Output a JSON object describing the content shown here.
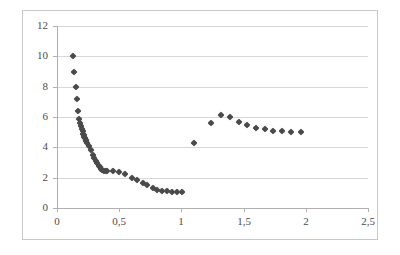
{
  "chart": {
    "title": "",
    "subtitle": "",
    "marker_color": "#4a4a4a",
    "gridline_color": "#d7d7d7",
    "axis_color": "#b0b0b0",
    "frame_color": "#c9c9c9",
    "background_color": "#ffffff"
  },
  "axes": {
    "x": {
      "label": "",
      "min": 0,
      "max": 2.5,
      "tick_step": 0.5,
      "tick_labels": [
        "0",
        "0,5",
        "1",
        "1,5",
        "2",
        "2,5"
      ],
      "tick_values": [
        0,
        0.5,
        1,
        1.5,
        2,
        2.5
      ]
    },
    "y": {
      "label": "",
      "min": 0,
      "max": 12,
      "tick_step": 2,
      "tick_labels": [
        "0",
        "2",
        "4",
        "6",
        "8",
        "10",
        "12"
      ],
      "tick_values": [
        0,
        2,
        4,
        6,
        8,
        10,
        12
      ]
    }
  },
  "chart_data": {
    "type": "scatter",
    "title": "",
    "xlabel": "",
    "ylabel": "",
    "xlim": [
      0,
      2.5
    ],
    "ylim": [
      0,
      12
    ],
    "grid": true,
    "legend": false,
    "xtick_labels": [
      "0",
      "0,5",
      "1",
      "1,5",
      "2",
      "2,5"
    ],
    "ytick_labels": [
      "0",
      "2",
      "4",
      "6",
      "8",
      "10",
      "12"
    ],
    "series": [
      {
        "name": "series-1",
        "marker": "diamond",
        "color": "#4a4a4a",
        "points": [
          [
            0.13,
            10.0
          ],
          [
            0.14,
            9.0
          ],
          [
            0.15,
            8.0
          ],
          [
            0.16,
            7.2
          ],
          [
            0.17,
            6.4
          ],
          [
            0.18,
            5.85
          ],
          [
            0.185,
            5.6
          ],
          [
            0.19,
            5.4
          ],
          [
            0.2,
            5.2
          ],
          [
            0.205,
            5.05
          ],
          [
            0.21,
            4.9
          ],
          [
            0.215,
            4.8
          ],
          [
            0.22,
            4.7
          ],
          [
            0.225,
            4.6
          ],
          [
            0.23,
            4.5
          ],
          [
            0.235,
            4.45
          ],
          [
            0.245,
            4.3
          ],
          [
            0.26,
            4.1
          ],
          [
            0.275,
            3.8
          ],
          [
            0.29,
            3.5
          ],
          [
            0.3,
            3.3
          ],
          [
            0.315,
            3.1
          ],
          [
            0.325,
            2.95
          ],
          [
            0.335,
            2.8
          ],
          [
            0.345,
            2.7
          ],
          [
            0.355,
            2.6
          ],
          [
            0.365,
            2.5
          ],
          [
            0.375,
            2.45
          ],
          [
            0.39,
            2.45
          ],
          [
            0.405,
            2.45
          ],
          [
            0.45,
            2.45
          ],
          [
            0.5,
            2.35
          ],
          [
            0.545,
            2.25
          ],
          [
            0.6,
            2.0
          ],
          [
            0.645,
            1.85
          ],
          [
            0.69,
            1.65
          ],
          [
            0.725,
            1.5
          ],
          [
            0.77,
            1.35
          ],
          [
            0.805,
            1.2
          ],
          [
            0.845,
            1.1
          ],
          [
            0.885,
            1.1
          ],
          [
            0.925,
            1.05
          ],
          [
            0.965,
            1.05
          ],
          [
            1.005,
            1.05
          ]
        ]
      },
      {
        "name": "series-2",
        "marker": "diamond",
        "color": "#4a4a4a",
        "points": [
          [
            1.1,
            4.3
          ],
          [
            1.24,
            5.6
          ],
          [
            1.32,
            6.1
          ],
          [
            1.39,
            6.0
          ],
          [
            1.46,
            5.7
          ],
          [
            1.53,
            5.45
          ],
          [
            1.6,
            5.3
          ],
          [
            1.67,
            5.2
          ],
          [
            1.74,
            5.1
          ],
          [
            1.81,
            5.05
          ],
          [
            1.88,
            5.0
          ],
          [
            1.96,
            5.0
          ]
        ]
      }
    ]
  }
}
